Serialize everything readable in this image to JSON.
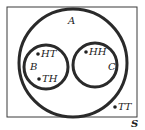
{
  "diagram": {
    "type": "venn",
    "universe": {
      "label": "S",
      "rect": {
        "x": 7,
        "y": 7,
        "w": 130,
        "h": 110
      }
    },
    "sets": [
      {
        "id": "A",
        "label": "A",
        "cx": 73,
        "cy": 63,
        "r": 55
      },
      {
        "id": "B",
        "label": "B",
        "cx": 46,
        "cy": 67,
        "r": 22
      },
      {
        "id": "C",
        "label": "C",
        "cx": 95,
        "cy": 65,
        "r": 22
      }
    ],
    "elements": [
      {
        "label": "HT",
        "x": 38,
        "y": 57,
        "set": "B"
      },
      {
        "label": "TH",
        "x": 39,
        "y": 82,
        "set": "B"
      },
      {
        "label": "HH",
        "x": 86,
        "y": 55,
        "set": "C"
      },
      {
        "label": "TT",
        "x": 115,
        "y": 110,
        "set": "none"
      }
    ],
    "colors": {
      "stroke": "#2a2a2a",
      "text": "#222222",
      "background": "#ffffff"
    }
  }
}
